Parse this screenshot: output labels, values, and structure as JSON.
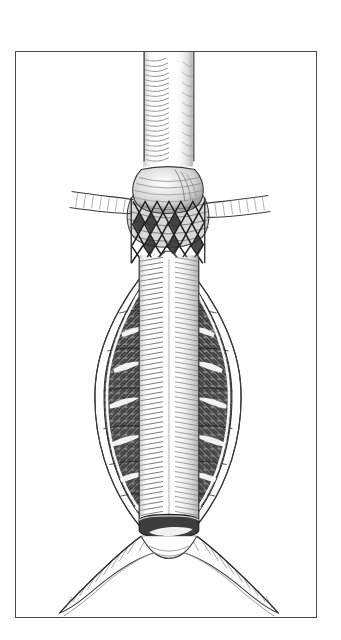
{
  "figure": {
    "domain": "medical-anatomical-illustration",
    "title": "Abdominal aortic aneurysm with endovascular stent graft",
    "medium": "pen-and-ink line drawing",
    "orientation": "portrait",
    "background_color": "#ffffff",
    "frame": {
      "name": "plate-border",
      "visible": true,
      "stroke_color": "#4a4a4c",
      "stroke_width_px": 1,
      "left_px": 15,
      "top_px": 51,
      "width_px": 302,
      "height_px": 567
    },
    "ink_colors": {
      "line": "#2b2b2d",
      "mid_tone": "#6e6e70",
      "light_tone": "#b8b8ba",
      "thrombus_dark": "#3a3a3c",
      "highlight": "#ffffff"
    },
    "labels": [],
    "annotations": [],
    "caption": ""
  },
  "anatomy": {
    "parts": [
      {
        "id": "suprarenal-aorta",
        "label": "Suprarenal aorta",
        "description": "Straight cylindrical vessel entering from the top of the plate, rendered with curved parallel hatch strokes suggesting a tube.",
        "center_x_px": 170,
        "top_px": 60,
        "bottom_px": 160,
        "width_px": 52
      },
      {
        "id": "renal-artery-left",
        "label": "Left renal artery",
        "description": "Short lateral branch leaving the aorta to the viewer's left at the aneurysm neck.",
        "y_px": 180,
        "extends_to_x_px": 108
      },
      {
        "id": "renal-artery-right",
        "label": "Right renal artery",
        "description": "Short lateral branch leaving the aorta to the viewer's right at the aneurysm neck.",
        "y_px": 184,
        "extends_to_x_px": 232
      },
      {
        "id": "proximal-neck",
        "label": "Proximal aneurysm neck",
        "description": "Bulged collar of aortic wall just below the renal arteries where the graft is seated.",
        "top_px": 150,
        "bottom_px": 200
      },
      {
        "id": "stent-mesh",
        "label": "Self-expanding stent (bare metal struts)",
        "description": "Zig-zag diamond lattice of wire struts, two rows of diamonds, seating the graft against the aortic neck.",
        "top_px": 196,
        "bottom_px": 258,
        "rows": 3,
        "columns": 4,
        "pattern": "diamond-lattice"
      },
      {
        "id": "aneurysm-sac",
        "label": "Aneurysm sac",
        "description": "Large fusiform dilatation of the infrarenal aorta, widest near mid-height, outlined by a thin white wall line.",
        "top_px": 258,
        "bottom_px": 500,
        "max_width_px": 150,
        "widest_y_px": 370
      },
      {
        "id": "mural-thrombus",
        "label": "Mural thrombus",
        "description": "Dark crosshatched laminated clot filling the space between the aneurysm wall and the graft, on both sides of the lumen, with pale highlight streaks.",
        "tone": "dark crosshatch",
        "sides": [
          "left",
          "right"
        ]
      },
      {
        "id": "graft-body",
        "label": "Endovascular graft body",
        "description": "Pale ribbed fabric tube running straight down the centre of the aneurysm sac, drawn with dense horizontal rib strokes.",
        "center_x_px": 170,
        "top_px": 200,
        "bottom_px": 512,
        "width_px": 46
      },
      {
        "id": "distal-neck",
        "label": "Distal landing zone",
        "description": "Dark shaded cuff where the graft ends just above the aortic bifurcation.",
        "y_px": 512,
        "width_px": 54
      },
      {
        "id": "aortic-bifurcation",
        "label": "Aortic bifurcation",
        "description": "Inverted-V split of the distal aorta into the two common iliac arteries.",
        "apex_y_px": 528
      },
      {
        "id": "common-iliac-left",
        "label": "Left common iliac artery",
        "description": "Branch running down and outward to the viewer's left, hatched along its inner curve.",
        "end_x_px": 92,
        "end_y_px": 598
      },
      {
        "id": "common-iliac-right",
        "label": "Right common iliac artery",
        "description": "Branch running down and outward to the viewer's right, hatched along its inner curve.",
        "end_x_px": 248,
        "end_y_px": 598
      }
    ]
  },
  "toolbar": {
    "visible": false,
    "items": []
  }
}
